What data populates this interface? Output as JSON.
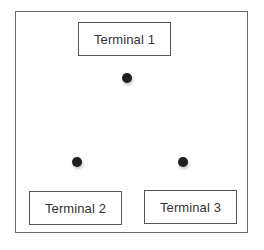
{
  "diagram": {
    "terminals": [
      {
        "label": "Terminal 1"
      },
      {
        "label": "Terminal 2"
      },
      {
        "label": "Terminal 3"
      }
    ],
    "points": [
      {
        "name": "point-1",
        "near": "Terminal 1"
      },
      {
        "name": "point-2",
        "near": "Terminal 2"
      },
      {
        "name": "point-3",
        "near": "Terminal 3"
      }
    ],
    "colors": {
      "border": "#6e6e6e",
      "box_border": "#555555",
      "dot": "#1e1e1e",
      "text": "#333333"
    }
  }
}
